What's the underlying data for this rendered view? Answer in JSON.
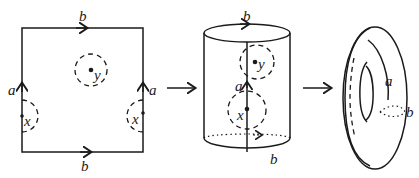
{
  "diagram": {
    "panels": [
      {
        "name": "square",
        "labels": {
          "top": "b",
          "bottom": "b",
          "left": "a",
          "right": "a",
          "point_center": "y",
          "point_left": "x",
          "point_right": "x"
        }
      },
      {
        "name": "cylinder",
        "labels": {
          "top": "b",
          "bottom": "b",
          "seam": "a",
          "point_upper": "y",
          "point_lower": "x"
        }
      },
      {
        "name": "torus",
        "labels": {
          "meridian": "a",
          "longitude": "b"
        }
      }
    ],
    "arrows": [
      "→",
      "→"
    ],
    "colors": {
      "ink": "#1a1a1a",
      "background": "#ffffff"
    }
  }
}
